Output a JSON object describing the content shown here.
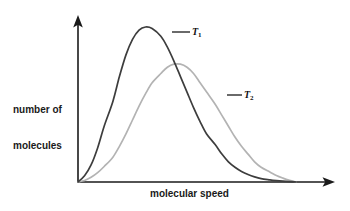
{
  "chart_data": {
    "type": "line",
    "title": "",
    "subtitle": "",
    "xlabel": "molecular speed",
    "ylabel": "number of molecules",
    "grid": false,
    "legend_position": "inline-annotation",
    "axis_style": "arrow-headed open axes, no tick marks, no tick labels",
    "xlim": [
      0,
      1
    ],
    "ylim": [
      0,
      1
    ],
    "annotations": [
      {
        "name": "T1",
        "text": "T",
        "subscript": "1",
        "leader_line": true
      },
      {
        "name": "T2",
        "text": "T",
        "subscript": "2",
        "leader_line": true
      }
    ],
    "series": [
      {
        "name": "T1",
        "label": "T",
        "label_subscript": "1",
        "color": "#3d3d3d",
        "description": "lower temperature Maxwell-Boltzmann distribution: taller, narrower, peak at lower speed",
        "peak_x": 0.31,
        "peak_y": 1.0,
        "x": [
          0.0,
          0.03,
          0.06,
          0.09,
          0.12,
          0.16,
          0.19,
          0.22,
          0.25,
          0.28,
          0.31,
          0.34,
          0.38,
          0.41,
          0.44,
          0.47,
          0.5,
          0.53,
          0.56,
          0.59,
          0.63,
          0.66,
          0.69,
          0.72,
          0.75,
          0.78,
          0.81,
          0.84,
          0.88,
          0.91,
          0.94,
          0.97,
          1.0
        ],
        "y": [
          0.0,
          0.04,
          0.11,
          0.22,
          0.36,
          0.52,
          0.68,
          0.82,
          0.92,
          0.98,
          1.0,
          0.99,
          0.94,
          0.87,
          0.78,
          0.68,
          0.58,
          0.48,
          0.39,
          0.31,
          0.24,
          0.18,
          0.13,
          0.095,
          0.068,
          0.048,
          0.033,
          0.022,
          0.014,
          0.009,
          0.005,
          0.002,
          0.0
        ]
      },
      {
        "name": "T2",
        "label": "T",
        "label_subscript": "2",
        "color": "#b3b3b3",
        "description": "higher temperature Maxwell-Boltzmann distribution: shorter, broader, peak shifted to higher speed",
        "peak_x": 0.44,
        "peak_y": 0.76,
        "x": [
          0.0,
          0.03,
          0.06,
          0.09,
          0.12,
          0.16,
          0.19,
          0.22,
          0.25,
          0.28,
          0.31,
          0.34,
          0.38,
          0.41,
          0.44,
          0.47,
          0.5,
          0.53,
          0.56,
          0.59,
          0.63,
          0.66,
          0.69,
          0.72,
          0.75,
          0.78,
          0.81,
          0.84,
          0.88,
          0.91,
          0.94,
          0.97,
          1.0
        ],
        "y": [
          0.0,
          0.01,
          0.03,
          0.06,
          0.1,
          0.16,
          0.23,
          0.31,
          0.4,
          0.49,
          0.57,
          0.64,
          0.7,
          0.74,
          0.76,
          0.76,
          0.74,
          0.7,
          0.64,
          0.58,
          0.5,
          0.43,
          0.36,
          0.29,
          0.23,
          0.18,
          0.13,
          0.095,
          0.065,
          0.042,
          0.025,
          0.011,
          0.0
        ]
      }
    ]
  },
  "axes": {
    "y_label_line1": "number of",
    "y_label_line2": "molecules",
    "x_label": "molecular speed"
  },
  "labels": {
    "t1_base": "T",
    "t1_sub": "1",
    "t2_base": "T",
    "t2_sub": "2"
  },
  "colors": {
    "background": "#ffffff",
    "axis": "#1a1a1a",
    "text": "#1a1a1a",
    "series_t1": "#3d3d3d",
    "series_t2": "#b3b3b3"
  }
}
